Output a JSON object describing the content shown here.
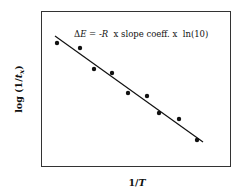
{
  "chart_data": {
    "type": "scatter",
    "title": "",
    "annotation": "ΔE = -R  x slope coeff. x  ln(10)",
    "xlabel": "1/T",
    "ylabel": "log (1/t_x)",
    "grid": false,
    "legend": null,
    "axis_ticks": "none",
    "series": [
      {
        "name": "data points",
        "kind": "scatter",
        "points": [
          {
            "x": 57,
            "y": 43
          },
          {
            "x": 80,
            "y": 48
          },
          {
            "x": 94,
            "y": 69
          },
          {
            "x": 112,
            "y": 73
          },
          {
            "x": 128,
            "y": 93
          },
          {
            "x": 147,
            "y": 96
          },
          {
            "x": 159,
            "y": 113
          },
          {
            "x": 179,
            "y": 119
          },
          {
            "x": 197,
            "y": 140
          }
        ]
      },
      {
        "name": "linear fit",
        "kind": "line",
        "points": [
          {
            "x": 55,
            "y": 36
          },
          {
            "x": 203,
            "y": 142
          }
        ]
      }
    ]
  },
  "labels": {
    "annotation_prefix": "Δ",
    "annotation_E": "E",
    "annotation_eq": " = -",
    "annotation_R": "R",
    "annotation_rest": "  x slope coeff. x  ln(10)",
    "ylabel_main": "log (1/",
    "ylabel_t": "t",
    "ylabel_sub": "x",
    "ylabel_close": ")",
    "xlabel_main": "1/",
    "xlabel_T": "T"
  },
  "frame": {
    "x": 41,
    "y": 11,
    "width": 189,
    "height": 155
  }
}
